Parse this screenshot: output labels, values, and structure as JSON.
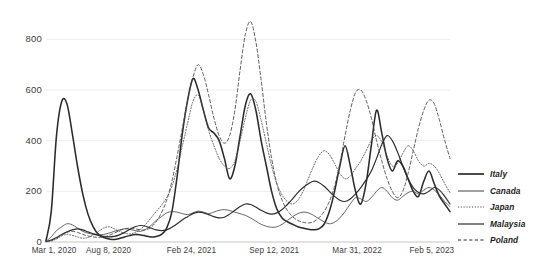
{
  "chart_data": {
    "type": "line",
    "title": "",
    "subtitle": "",
    "xlabel": "",
    "ylabel": "",
    "ylim": [
      0,
      900
    ],
    "yticks": [
      0,
      200,
      400,
      600,
      800
    ],
    "ytick_labels": [
      "0",
      "200",
      "400",
      "600",
      "800"
    ],
    "xtick_labels": [
      "Mar 1, 2020",
      "Aug 8, 2020",
      "Feb 24, 2021",
      "Sep 12, 2021",
      "Mar 31, 2022",
      "Feb 5, 2023"
    ],
    "xtick_positions": [
      0.02,
      0.155,
      0.36,
      0.565,
      0.77,
      0.955
    ],
    "grid": true,
    "legend_position": "right",
    "x_start": "Mar 1, 2020",
    "x_end": "Feb 5, 2023",
    "x_count": 78,
    "series": [
      {
        "name": "Italy",
        "style": "solid-thick",
        "color": "#2b2b2b",
        "values": [
          5,
          120,
          420,
          555,
          545,
          430,
          300,
          190,
          110,
          60,
          30,
          18,
          12,
          10,
          14,
          20,
          26,
          30,
          28,
          24,
          20,
          22,
          30,
          55,
          120,
          260,
          430,
          560,
          645,
          600,
          520,
          450,
          430,
          400,
          330,
          250,
          300,
          420,
          540,
          585,
          520,
          400,
          300,
          200,
          130,
          95,
          80,
          70,
          60,
          55,
          50,
          48,
          52,
          70,
          120,
          200,
          300,
          380,
          300,
          200,
          150,
          230,
          380,
          520,
          430,
          330,
          280,
          320,
          300,
          250,
          200,
          180,
          240,
          280,
          230,
          180,
          150,
          120
        ]
      },
      {
        "name": "Canada",
        "style": "solid-thin",
        "color": "#4a4a4a",
        "values": [
          3,
          20,
          45,
          60,
          72,
          68,
          55,
          42,
          35,
          30,
          28,
          30,
          35,
          42,
          48,
          52,
          50,
          45,
          42,
          50,
          65,
          85,
          100,
          115,
          120,
          118,
          112,
          108,
          115,
          122,
          118,
          112,
          118,
          125,
          128,
          124,
          118,
          112,
          105,
          95,
          82,
          70,
          62,
          58,
          60,
          70,
          85,
          100,
          112,
          118,
          115,
          105,
          92,
          80,
          72,
          78,
          95,
          120,
          150,
          175,
          170,
          160,
          175,
          200,
          215,
          200,
          175,
          165,
          180,
          195,
          200,
          190,
          205,
          215,
          205,
          185,
          160,
          140
        ]
      },
      {
        "name": "Japan",
        "style": "dotted",
        "color": "#4a4a4a",
        "values": [
          1,
          4,
          12,
          24,
          30,
          26,
          20,
          15,
          18,
          28,
          42,
          55,
          60,
          52,
          42,
          35,
          32,
          38,
          50,
          70,
          95,
          120,
          145,
          175,
          220,
          290,
          380,
          470,
          555,
          580,
          520,
          440,
          380,
          330,
          300,
          290,
          320,
          400,
          490,
          560,
          555,
          480,
          390,
          300,
          230,
          185,
          160,
          150,
          165,
          200,
          250,
          300,
          340,
          360,
          345,
          310,
          270,
          250,
          260,
          290,
          320,
          360,
          400,
          420,
          395,
          340,
          300,
          310,
          350,
          380,
          360,
          320,
          300,
          310,
          300,
          270,
          230,
          195
        ]
      },
      {
        "name": "Malaysia",
        "style": "solid-medium",
        "color": "#2b2b2b",
        "values": [
          2,
          8,
          18,
          30,
          40,
          48,
          52,
          48,
          40,
          32,
          26,
          22,
          20,
          22,
          28,
          38,
          50,
          60,
          65,
          62,
          55,
          48,
          45,
          48,
          58,
          72,
          88,
          100,
          112,
          118,
          115,
          108,
          100,
          95,
          98,
          110,
          125,
          140,
          150,
          148,
          138,
          125,
          115,
          110,
          115,
          128,
          148,
          170,
          195,
          215,
          230,
          240,
          235,
          220,
          200,
          180,
          165,
          160,
          170,
          190,
          215,
          245,
          280,
          330,
          385,
          420,
          400,
          355,
          300,
          250,
          215,
          195,
          190,
          200,
          215,
          205,
          180,
          150
        ]
      },
      {
        "name": "Poland",
        "style": "dashed",
        "color": "#4a4a4a",
        "values": [
          1,
          6,
          15,
          28,
          38,
          42,
          38,
          30,
          24,
          20,
          18,
          20,
          26,
          35,
          45,
          52,
          55,
          52,
          48,
          48,
          58,
          80,
          115,
          165,
          240,
          340,
          450,
          560,
          650,
          700,
          660,
          580,
          490,
          420,
          390,
          420,
          520,
          680,
          820,
          870,
          790,
          640,
          470,
          330,
          230,
          165,
          125,
          100,
          85,
          78,
          75,
          80,
          95,
          120,
          160,
          220,
          310,
          420,
          520,
          590,
          600,
          560,
          490,
          400,
          320,
          250,
          200,
          175,
          200,
          270,
          360,
          450,
          520,
          560,
          545,
          480,
          400,
          330
        ]
      }
    ]
  },
  "legend": {
    "items": [
      {
        "label": "Italy",
        "style": "solid-thick"
      },
      {
        "label": "Canada",
        "style": "solid-thin"
      },
      {
        "label": "Japan",
        "style": "dotted"
      },
      {
        "label": "Malaysia",
        "style": "solid-medium"
      },
      {
        "label": "Poland",
        "style": "dashed"
      }
    ]
  }
}
